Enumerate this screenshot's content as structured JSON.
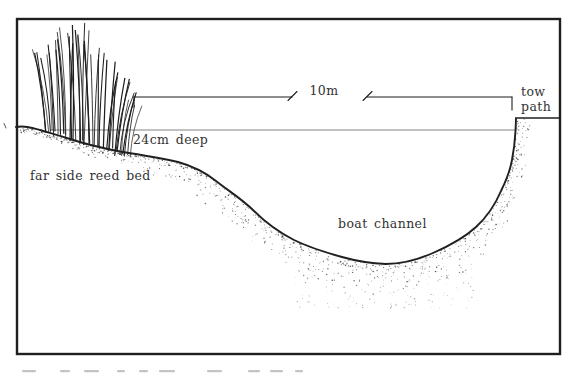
{
  "diagram": {
    "labels": {
      "reed_bed": "far side reed bed",
      "depth": "24cm deep",
      "channel_width": "10m",
      "channel": "boat channel",
      "tow_path": "tow path"
    },
    "colors": {
      "ink": "#1f1f1f",
      "paper": "#ffffff",
      "water_line": "#777777",
      "text": "#333333",
      "caption_fragment": "#8a8a8a"
    }
  }
}
